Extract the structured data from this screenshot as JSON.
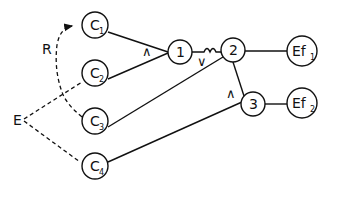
{
  "diagram": {
    "colors": {
      "stroke": "#111111",
      "background": "#ffffff"
    },
    "nodes": {
      "C1": {
        "label": "C",
        "sub": "1"
      },
      "C2": {
        "label": "C",
        "sub": "2"
      },
      "C3": {
        "label": "C",
        "sub": "3"
      },
      "C4": {
        "label": "C",
        "sub": "4"
      },
      "n1": {
        "label": "1"
      },
      "n2": {
        "label": "2"
      },
      "n3": {
        "label": "3"
      },
      "Ef1": {
        "label": "Ef",
        "sub": "1"
      },
      "Ef2": {
        "label": "Ef",
        "sub": "2"
      }
    },
    "side_labels": {
      "R": "R",
      "E": "E"
    },
    "operators": {
      "and_1": "∧",
      "or_2": "∨",
      "and_3": "∧"
    }
  }
}
